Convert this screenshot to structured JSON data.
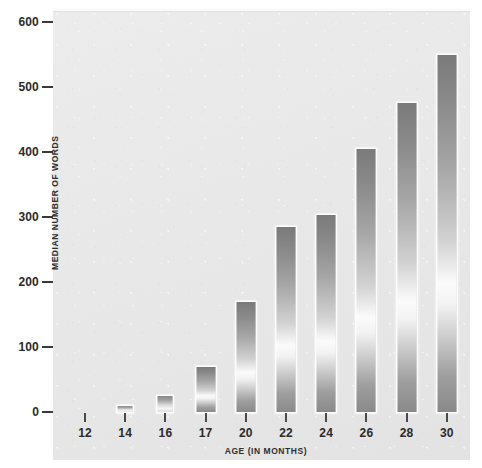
{
  "chart_data": {
    "type": "bar",
    "title": "",
    "xlabel": "AGE (IN MONTHS)",
    "ylabel": "MEDIAN NUMBER OF WORDS",
    "categories": [
      "12",
      "14",
      "16",
      "17",
      "20",
      "22",
      "24",
      "26",
      "28",
      "30"
    ],
    "values": [
      0,
      10,
      25,
      70,
      170,
      285,
      303,
      405,
      475,
      550
    ],
    "series": [
      {
        "name": "Median number of words",
        "values": [
          0,
          10,
          25,
          70,
          170,
          285,
          303,
          405,
          475,
          550
        ]
      }
    ],
    "ylim": [
      0,
      600
    ],
    "y_ticks": [
      0,
      100,
      200,
      300,
      400,
      500,
      600
    ],
    "y_tick_labels": [
      "0",
      "100",
      "200",
      "300",
      "400",
      "500",
      "600"
    ],
    "grid": false,
    "legend": false,
    "legend_position": "none",
    "colors": {
      "bar_top": "#7a7a7a",
      "bar_highlight": "#fbfbfb",
      "bar_bottom": "#8a8a8a",
      "plot_background": "#e9e9ea",
      "page_background": "#ffffff",
      "axis_text": "#2a2a2a",
      "tick_mark": "#3a3a3a"
    }
  }
}
